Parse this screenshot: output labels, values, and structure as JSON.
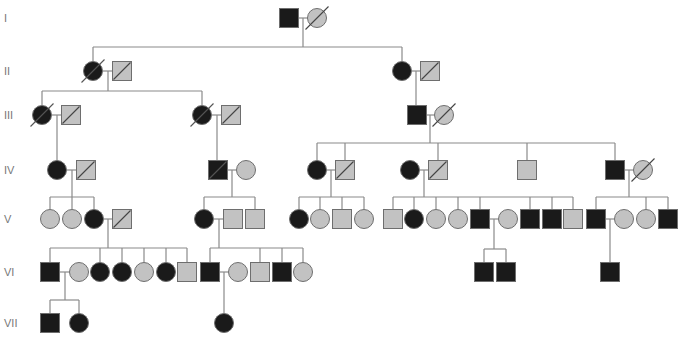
{
  "colors": {
    "affected": "#1a1a1a",
    "unaffected": "#c2c2c2",
    "stroke": "#6e6e6e",
    "line": "#8a8a8a",
    "label": "#777777"
  },
  "symbol_size": 19,
  "generations": [
    {
      "label": "I",
      "y": 18
    },
    {
      "label": "II",
      "y": 71
    },
    {
      "label": "III",
      "y": 115
    },
    {
      "label": "IV",
      "y": 170
    },
    {
      "label": "V",
      "y": 219
    },
    {
      "label": "VI",
      "y": 272
    },
    {
      "label": "VII",
      "y": 323
    }
  ],
  "individuals": [
    {
      "id": "I-1",
      "sex": "M",
      "affected": true,
      "deceased": false,
      "x": 289,
      "y": 18
    },
    {
      "id": "I-2",
      "sex": "F",
      "affected": false,
      "deceased": true,
      "x": 317,
      "y": 18
    },
    {
      "id": "II-1",
      "sex": "F",
      "affected": true,
      "deceased": true,
      "x": 93,
      "y": 71
    },
    {
      "id": "II-2",
      "sex": "M",
      "affected": false,
      "deceased": true,
      "x": 122,
      "y": 71
    },
    {
      "id": "II-3",
      "sex": "F",
      "affected": true,
      "deceased": false,
      "x": 402,
      "y": 71
    },
    {
      "id": "II-4",
      "sex": "M",
      "affected": false,
      "deceased": true,
      "x": 430,
      "y": 71
    },
    {
      "id": "III-1",
      "sex": "F",
      "affected": true,
      "deceased": true,
      "x": 42,
      "y": 115
    },
    {
      "id": "III-2",
      "sex": "M",
      "affected": false,
      "deceased": true,
      "x": 71,
      "y": 115
    },
    {
      "id": "III-3",
      "sex": "F",
      "affected": true,
      "deceased": true,
      "x": 202,
      "y": 115
    },
    {
      "id": "III-4",
      "sex": "M",
      "affected": false,
      "deceased": true,
      "x": 231,
      "y": 115
    },
    {
      "id": "III-5",
      "sex": "M",
      "affected": true,
      "deceased": false,
      "x": 417,
      "y": 115
    },
    {
      "id": "III-6",
      "sex": "F",
      "affected": false,
      "deceased": true,
      "x": 444,
      "y": 115
    },
    {
      "id": "IV-1",
      "sex": "F",
      "affected": true,
      "deceased": false,
      "x": 57,
      "y": 170
    },
    {
      "id": "IV-2",
      "sex": "M",
      "affected": false,
      "deceased": true,
      "x": 86,
      "y": 170
    },
    {
      "id": "IV-3",
      "sex": "M",
      "affected": true,
      "deceased": true,
      "x": 218,
      "y": 170
    },
    {
      "id": "IV-4",
      "sex": "F",
      "affected": false,
      "deceased": false,
      "x": 246,
      "y": 170
    },
    {
      "id": "IV-5",
      "sex": "F",
      "affected": true,
      "deceased": false,
      "x": 317,
      "y": 170
    },
    {
      "id": "IV-6",
      "sex": "M",
      "affected": false,
      "deceased": true,
      "x": 345,
      "y": 170
    },
    {
      "id": "IV-7",
      "sex": "F",
      "affected": true,
      "deceased": false,
      "x": 410,
      "y": 170
    },
    {
      "id": "IV-8",
      "sex": "M",
      "affected": false,
      "deceased": true,
      "x": 438,
      "y": 170
    },
    {
      "id": "IV-9",
      "sex": "M",
      "affected": false,
      "deceased": false,
      "x": 527,
      "y": 170
    },
    {
      "id": "IV-10",
      "sex": "M",
      "affected": true,
      "deceased": false,
      "x": 615,
      "y": 170
    },
    {
      "id": "IV-11",
      "sex": "F",
      "affected": false,
      "deceased": true,
      "x": 643,
      "y": 170
    },
    {
      "id": "V-1",
      "sex": "F",
      "affected": false,
      "deceased": false,
      "x": 50,
      "y": 219
    },
    {
      "id": "V-2",
      "sex": "F",
      "affected": false,
      "deceased": false,
      "x": 72,
      "y": 219
    },
    {
      "id": "V-3",
      "sex": "F",
      "affected": true,
      "deceased": false,
      "x": 94,
      "y": 219
    },
    {
      "id": "V-4",
      "sex": "M",
      "affected": false,
      "deceased": true,
      "x": 122,
      "y": 219
    },
    {
      "id": "V-5",
      "sex": "F",
      "affected": true,
      "deceased": false,
      "x": 204,
      "y": 219
    },
    {
      "id": "V-6",
      "sex": "M",
      "affected": false,
      "deceased": false,
      "x": 233,
      "y": 219
    },
    {
      "id": "V-7",
      "sex": "M",
      "affected": false,
      "deceased": false,
      "x": 255,
      "y": 219
    },
    {
      "id": "V-8",
      "sex": "F",
      "affected": true,
      "deceased": false,
      "x": 299,
      "y": 219
    },
    {
      "id": "V-9",
      "sex": "F",
      "affected": false,
      "deceased": false,
      "x": 320,
      "y": 219
    },
    {
      "id": "V-10",
      "sex": "M",
      "affected": false,
      "deceased": false,
      "x": 342,
      "y": 219
    },
    {
      "id": "V-11",
      "sex": "F",
      "affected": false,
      "deceased": false,
      "x": 364,
      "y": 219
    },
    {
      "id": "V-12",
      "sex": "M",
      "affected": false,
      "deceased": false,
      "x": 393,
      "y": 219
    },
    {
      "id": "V-13",
      "sex": "F",
      "affected": true,
      "deceased": false,
      "x": 414,
      "y": 219
    },
    {
      "id": "V-14",
      "sex": "F",
      "affected": false,
      "deceased": false,
      "x": 436,
      "y": 219
    },
    {
      "id": "V-15",
      "sex": "F",
      "affected": false,
      "deceased": false,
      "x": 458,
      "y": 219
    },
    {
      "id": "V-16",
      "sex": "M",
      "affected": true,
      "deceased": false,
      "x": 480,
      "y": 219
    },
    {
      "id": "V-17",
      "sex": "F",
      "affected": false,
      "deceased": false,
      "x": 508,
      "y": 219
    },
    {
      "id": "V-18",
      "sex": "M",
      "affected": true,
      "deceased": false,
      "x": 530,
      "y": 219
    },
    {
      "id": "V-19",
      "sex": "M",
      "affected": true,
      "deceased": false,
      "x": 552,
      "y": 219
    },
    {
      "id": "V-20",
      "sex": "M",
      "affected": false,
      "deceased": false,
      "x": 573,
      "y": 219
    },
    {
      "id": "V-21",
      "sex": "M",
      "affected": true,
      "deceased": false,
      "x": 596,
      "y": 219
    },
    {
      "id": "V-22",
      "sex": "F",
      "affected": false,
      "deceased": false,
      "x": 624,
      "y": 219
    },
    {
      "id": "V-23",
      "sex": "F",
      "affected": false,
      "deceased": false,
      "x": 646,
      "y": 219
    },
    {
      "id": "V-24",
      "sex": "M",
      "affected": true,
      "deceased": false,
      "x": 668,
      "y": 219
    },
    {
      "id": "VI-1",
      "sex": "M",
      "affected": true,
      "deceased": false,
      "x": 50,
      "y": 272
    },
    {
      "id": "VI-2",
      "sex": "F",
      "affected": false,
      "deceased": false,
      "x": 79,
      "y": 272
    },
    {
      "id": "VI-3",
      "sex": "F",
      "affected": true,
      "deceased": false,
      "x": 100,
      "y": 272
    },
    {
      "id": "VI-4",
      "sex": "F",
      "affected": true,
      "deceased": false,
      "x": 122,
      "y": 272
    },
    {
      "id": "VI-5",
      "sex": "F",
      "affected": false,
      "deceased": false,
      "x": 144,
      "y": 272
    },
    {
      "id": "VI-6",
      "sex": "F",
      "affected": true,
      "deceased": false,
      "x": 166,
      "y": 272
    },
    {
      "id": "VI-7",
      "sex": "M",
      "affected": false,
      "deceased": false,
      "x": 187,
      "y": 272
    },
    {
      "id": "VI-8",
      "sex": "M",
      "affected": true,
      "deceased": false,
      "x": 210,
      "y": 272
    },
    {
      "id": "VI-9",
      "sex": "F",
      "affected": false,
      "deceased": false,
      "x": 238,
      "y": 272
    },
    {
      "id": "VI-10",
      "sex": "M",
      "affected": false,
      "deceased": false,
      "x": 260,
      "y": 272
    },
    {
      "id": "VI-11",
      "sex": "M",
      "affected": true,
      "deceased": false,
      "x": 282,
      "y": 272
    },
    {
      "id": "VI-12",
      "sex": "F",
      "affected": false,
      "deceased": false,
      "x": 303,
      "y": 272
    },
    {
      "id": "VI-13",
      "sex": "M",
      "affected": true,
      "deceased": false,
      "x": 484,
      "y": 272
    },
    {
      "id": "VI-14",
      "sex": "M",
      "affected": true,
      "deceased": false,
      "x": 506,
      "y": 272
    },
    {
      "id": "VI-15",
      "sex": "M",
      "affected": true,
      "deceased": false,
      "x": 610,
      "y": 272
    },
    {
      "id": "VII-1",
      "sex": "M",
      "affected": true,
      "deceased": false,
      "x": 50,
      "y": 323
    },
    {
      "id": "VII-2",
      "sex": "F",
      "affected": true,
      "deceased": false,
      "x": 79,
      "y": 323
    },
    {
      "id": "VII-3",
      "sex": "F",
      "affected": true,
      "deceased": false,
      "x": 224,
      "y": 323
    }
  ],
  "lines": [
    [
      298,
      18,
      308,
      18
    ],
    [
      303,
      18,
      303,
      47
    ],
    [
      93,
      47,
      402,
      47
    ],
    [
      93,
      47,
      93,
      61
    ],
    [
      402,
      47,
      402,
      61
    ],
    [
      103,
      71,
      112,
      71
    ],
    [
      108,
      71,
      108,
      91
    ],
    [
      42,
      91,
      202,
      91
    ],
    [
      42,
      91,
      42,
      105
    ],
    [
      202,
      91,
      202,
      105
    ],
    [
      412,
      71,
      420,
      71
    ],
    [
      416,
      71,
      416,
      105
    ],
    [
      52,
      115,
      61,
      115
    ],
    [
      57,
      115,
      57,
      160
    ],
    [
      212,
      115,
      221,
      115
    ],
    [
      217,
      115,
      217,
      160
    ],
    [
      427,
      115,
      434,
      115
    ],
    [
      430,
      115,
      430,
      143
    ],
    [
      317,
      143,
      615,
      143
    ],
    [
      317,
      143,
      317,
      160
    ],
    [
      345,
      143,
      345,
      160
    ],
    [
      438,
      143,
      438,
      160
    ],
    [
      527,
      143,
      527,
      160
    ],
    [
      615,
      143,
      615,
      160
    ],
    [
      67,
      170,
      76,
      170
    ],
    [
      72,
      170,
      72,
      197
    ],
    [
      50,
      197,
      94,
      197
    ],
    [
      50,
      197,
      50,
      209
    ],
    [
      72,
      197,
      72,
      209
    ],
    [
      94,
      197,
      94,
      209
    ],
    [
      228,
      170,
      236,
      170
    ],
    [
      232,
      170,
      232,
      197
    ],
    [
      204,
      197,
      255,
      197
    ],
    [
      204,
      197,
      204,
      209
    ],
    [
      255,
      197,
      255,
      209
    ],
    [
      327,
      170,
      335,
      170
    ],
    [
      331,
      170,
      331,
      197
    ],
    [
      299,
      197,
      364,
      197
    ],
    [
      299,
      197,
      299,
      209
    ],
    [
      320,
      197,
      320,
      209
    ],
    [
      342,
      197,
      342,
      209
    ],
    [
      364,
      197,
      364,
      209
    ],
    [
      420,
      170,
      428,
      170
    ],
    [
      424,
      170,
      424,
      197
    ],
    [
      393,
      197,
      573,
      197
    ],
    [
      393,
      197,
      393,
      209
    ],
    [
      414,
      197,
      414,
      209
    ],
    [
      436,
      197,
      436,
      209
    ],
    [
      458,
      197,
      458,
      209
    ],
    [
      480,
      197,
      480,
      209
    ],
    [
      530,
      197,
      530,
      209
    ],
    [
      552,
      197,
      552,
      209
    ],
    [
      573,
      197,
      573,
      209
    ],
    [
      625,
      170,
      633,
      170
    ],
    [
      629,
      170,
      629,
      197
    ],
    [
      596,
      197,
      668,
      197
    ],
    [
      596,
      197,
      596,
      209
    ],
    [
      646,
      197,
      646,
      209
    ],
    [
      668,
      197,
      668,
      209
    ],
    [
      104,
      219,
      112,
      219
    ],
    [
      108,
      219,
      108,
      248
    ],
    [
      50,
      248,
      187,
      248
    ],
    [
      50,
      248,
      50,
      262
    ],
    [
      100,
      248,
      100,
      262
    ],
    [
      122,
      248,
      122,
      262
    ],
    [
      144,
      248,
      144,
      262
    ],
    [
      166,
      248,
      166,
      262
    ],
    [
      187,
      248,
      187,
      262
    ],
    [
      214,
      219,
      223,
      219
    ],
    [
      219,
      219,
      219,
      248
    ],
    [
      210,
      248,
      303,
      248
    ],
    [
      210,
      248,
      210,
      262
    ],
    [
      260,
      248,
      260,
      262
    ],
    [
      282,
      248,
      282,
      262
    ],
    [
      303,
      248,
      303,
      262
    ],
    [
      490,
      219,
      498,
      219
    ],
    [
      494,
      219,
      494,
      249
    ],
    [
      484,
      249,
      506,
      249
    ],
    [
      484,
      249,
      484,
      262
    ],
    [
      506,
      249,
      506,
      262
    ],
    [
      606,
      219,
      614,
      219
    ],
    [
      610,
      219,
      610,
      262
    ],
    [
      60,
      272,
      69,
      272
    ],
    [
      65,
      272,
      65,
      300
    ],
    [
      50,
      300,
      79,
      300
    ],
    [
      50,
      300,
      50,
      313
    ],
    [
      79,
      300,
      79,
      313
    ],
    [
      220,
      272,
      228,
      272
    ],
    [
      224,
      272,
      224,
      313
    ]
  ]
}
